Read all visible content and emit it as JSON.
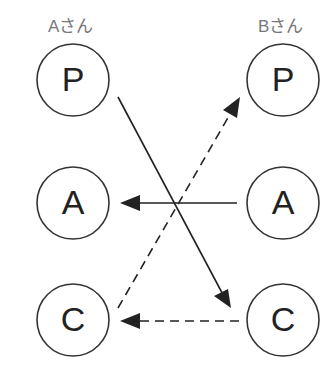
{
  "persons": {
    "a": {
      "label": "Aさん"
    },
    "b": {
      "label": "Bさん"
    }
  },
  "nodes": {
    "a_p": "P",
    "a_a": "A",
    "a_c": "C",
    "b_p": "P",
    "b_a": "A",
    "b_c": "C"
  },
  "edges": [
    {
      "from": "Aさん P",
      "to": "Bさん C",
      "style": "solid"
    },
    {
      "from": "Bさん A",
      "to": "Aさん A",
      "style": "solid"
    },
    {
      "from": "Aさん C",
      "to": "Bさん P",
      "style": "dashed"
    },
    {
      "from": "Bさん C",
      "to": "Aさん C",
      "style": "dashed"
    }
  ],
  "colors": {
    "stroke": "#333333",
    "label": "#777777"
  }
}
